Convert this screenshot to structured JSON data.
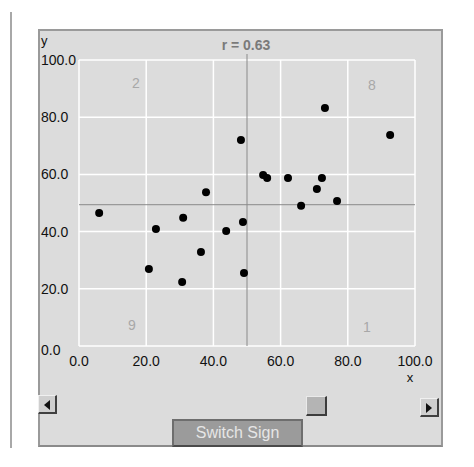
{
  "chart_data": {
    "type": "scatter",
    "title": "r = 0.63",
    "xlabel": "x",
    "ylabel": "y",
    "xlim": [
      0,
      100
    ],
    "ylim": [
      0,
      100
    ],
    "grid": true,
    "x_ticks": [
      "0.0",
      "20.0",
      "40.0",
      "60.0",
      "80.0",
      "100.0"
    ],
    "y_ticks": [
      "0.0",
      "20.0",
      "40.0",
      "60.0",
      "80.0",
      "100.0"
    ],
    "mean_lines": {
      "x": 50.0,
      "y": 49.4
    },
    "quadrant_counts": {
      "top_left": "2",
      "top_right": "8",
      "bottom_left": "9",
      "bottom_right": "1"
    },
    "points": [
      {
        "x": 6.0,
        "y": 46.5
      },
      {
        "x": 22.9,
        "y": 40.9
      },
      {
        "x": 31.0,
        "y": 44.8
      },
      {
        "x": 37.8,
        "y": 53.8
      },
      {
        "x": 43.8,
        "y": 40.2
      },
      {
        "x": 48.8,
        "y": 43.4
      },
      {
        "x": 36.3,
        "y": 32.9
      },
      {
        "x": 20.8,
        "y": 26.9
      },
      {
        "x": 30.7,
        "y": 22.4
      },
      {
        "x": 49.1,
        "y": 25.5
      },
      {
        "x": 48.2,
        "y": 72.0
      },
      {
        "x": 73.2,
        "y": 83.2
      },
      {
        "x": 92.6,
        "y": 73.8
      },
      {
        "x": 54.8,
        "y": 59.8
      },
      {
        "x": 56.0,
        "y": 58.7
      },
      {
        "x": 62.2,
        "y": 58.7
      },
      {
        "x": 72.3,
        "y": 58.7
      },
      {
        "x": 70.8,
        "y": 54.9
      },
      {
        "x": 66.1,
        "y": 49.0
      },
      {
        "x": 76.8,
        "y": 50.7
      }
    ]
  },
  "controls": {
    "switch_sign_label": "Switch Sign",
    "slider_position_pct": 68,
    "left_arrow_icon": "arrow-left-icon",
    "right_arrow_icon": "arrow-right-icon"
  },
  "colors": {
    "panel_bg": "#dcdcdc",
    "grid": "#ffffff",
    "mean_line": "#8a8a8a",
    "point": "#000000",
    "title": "#7a7a7a",
    "quadrant_label": "#a8a8a8",
    "button_bg": "#9b9b9b"
  }
}
